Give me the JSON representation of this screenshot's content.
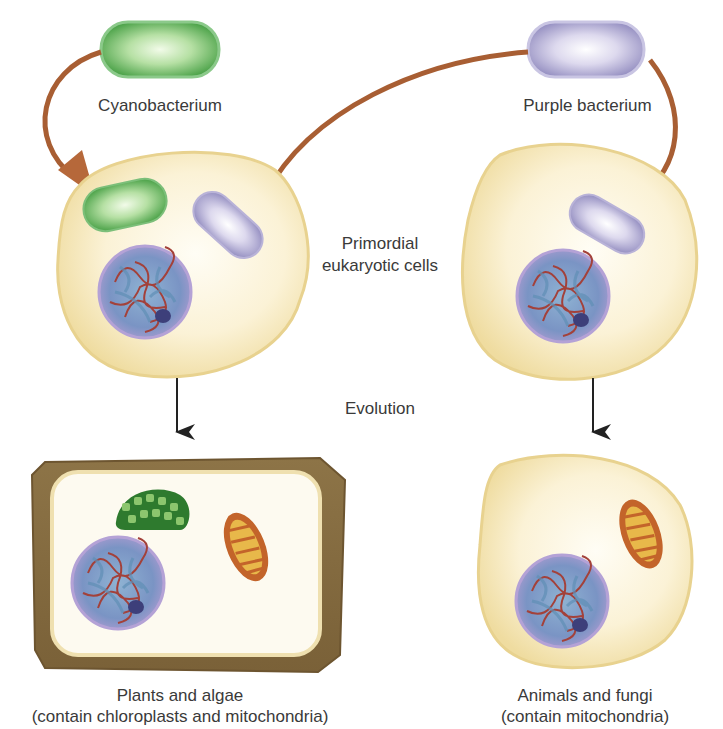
{
  "labels": {
    "cyanobacterium": "Cyanobacterium",
    "purple_bacterium": "Purple bacterium",
    "primordial_line1": "Primordial",
    "primordial_line2": "eukaryotic cells",
    "evolution": "Evolution",
    "plants_title": "Plants and algae",
    "plants_sub": "(contain chloroplasts and mitochondria)",
    "animals_title": "Animals and fungi",
    "animals_sub": "(contain mitochondria)"
  },
  "colors": {
    "cell_fill": "#f6eac0",
    "cell_edge": "#e3cf8f",
    "cell_wall": "#8a7045",
    "cyano_green": "#4aa24a",
    "purple": "#9b95c6",
    "arrow_brown": "#b6683a",
    "mito": "#c8662a",
    "nucleus": "#8b87c2",
    "text": "#3a3a3a"
  }
}
